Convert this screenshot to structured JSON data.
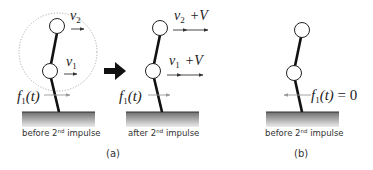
{
  "panels": [
    {
      "id": "a-before",
      "caption": "before 2",
      "caption_sup": "nd",
      "caption_tail": " impulse",
      "v2_label": "v",
      "v2_sub": "2",
      "v1_label": "v",
      "v1_sub": "1",
      "force_label": "f",
      "force_sub": "1",
      "force_arg": "(t)"
    },
    {
      "id": "a-after",
      "caption": "after 2",
      "caption_sup": "nd",
      "caption_tail": " impulse",
      "v2_label": "v",
      "v2_sub": "2",
      "v2_extra": "+V",
      "v1_label": "v",
      "v1_sub": "1",
      "v1_extra": "+V",
      "force_label": "f",
      "force_sub": "1",
      "force_arg": "(t)"
    },
    {
      "id": "b-before",
      "caption": "before 2",
      "caption_sup": "nd",
      "caption_tail": " impulse",
      "force_label": "f",
      "force_sub": "1",
      "force_arg": "(t)",
      "force_eq": " = 0"
    }
  ],
  "subfigure_labels": {
    "a": "(a)",
    "b": "(b)"
  },
  "colors": {
    "link": "#111111",
    "joint_fill": "#ffffff",
    "arrow": "#333333",
    "force_arrow": "#999999",
    "dotted_circle": "#999999",
    "ground_top": "#666666",
    "ground_bottom": "#e6e6e6",
    "big_arrow": "#111111"
  }
}
